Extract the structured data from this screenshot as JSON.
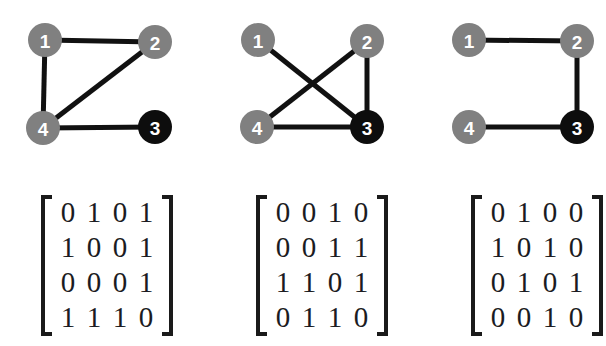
{
  "figure": {
    "background_color": "#ffffff",
    "node_colors": {
      "default": "#808080",
      "highlight": "#0d0d0d",
      "label": "#ffffff"
    },
    "edge_color": "#111111",
    "node_radius": 17,
    "matrix_text_color": "#1b1b22",
    "bracket_color": "#1a1a1a"
  },
  "panels": [
    {
      "id": "panel-1",
      "graph": {
        "nodes": [
          {
            "id": "1",
            "label": "1",
            "x": 45,
            "y": 40,
            "color": "#808080"
          },
          {
            "id": "2",
            "label": "2",
            "x": 155,
            "y": 42,
            "color": "#808080"
          },
          {
            "id": "3",
            "label": "3",
            "x": 155,
            "y": 127,
            "color": "#0d0d0d"
          },
          {
            "id": "4",
            "label": "4",
            "x": 43,
            "y": 128,
            "color": "#808080"
          }
        ],
        "edges": [
          {
            "from": "1",
            "to": "2"
          },
          {
            "from": "1",
            "to": "4"
          },
          {
            "from": "2",
            "to": "4"
          },
          {
            "from": "4",
            "to": "3"
          }
        ]
      },
      "matrix": {
        "rows": [
          [
            "0",
            "1",
            "0",
            "1"
          ],
          [
            "1",
            "0",
            "0",
            "1"
          ],
          [
            "0",
            "0",
            "0",
            "1"
          ],
          [
            "1",
            "1",
            "1",
            "0"
          ]
        ]
      }
    },
    {
      "id": "panel-2",
      "graph": {
        "nodes": [
          {
            "id": "1",
            "label": "1",
            "x": 58,
            "y": 40,
            "color": "#808080"
          },
          {
            "id": "2",
            "label": "2",
            "x": 167,
            "y": 41,
            "color": "#808080"
          },
          {
            "id": "3",
            "label": "3",
            "x": 167,
            "y": 127,
            "color": "#0d0d0d"
          },
          {
            "id": "4",
            "label": "4",
            "x": 57,
            "y": 127,
            "color": "#808080"
          }
        ],
        "edges": [
          {
            "from": "1",
            "to": "3"
          },
          {
            "from": "2",
            "to": "4"
          },
          {
            "from": "2",
            "to": "3"
          },
          {
            "from": "4",
            "to": "3"
          }
        ]
      },
      "matrix": {
        "rows": [
          [
            "0",
            "0",
            "1",
            "0"
          ],
          [
            "0",
            "0",
            "1",
            "1"
          ],
          [
            "1",
            "1",
            "0",
            "1"
          ],
          [
            "0",
            "1",
            "1",
            "0"
          ]
        ]
      }
    },
    {
      "id": "panel-3",
      "graph": {
        "nodes": [
          {
            "id": "1",
            "label": "1",
            "x": 65,
            "y": 40,
            "color": "#808080"
          },
          {
            "id": "2",
            "label": "2",
            "x": 173,
            "y": 41,
            "color": "#808080"
          },
          {
            "id": "3",
            "label": "3",
            "x": 173,
            "y": 127,
            "color": "#0d0d0d"
          },
          {
            "id": "4",
            "label": "4",
            "x": 65,
            "y": 127,
            "color": "#808080"
          }
        ],
        "edges": [
          {
            "from": "1",
            "to": "2"
          },
          {
            "from": "2",
            "to": "3"
          },
          {
            "from": "4",
            "to": "3"
          }
        ]
      },
      "matrix": {
        "rows": [
          [
            "0",
            "1",
            "0",
            "0"
          ],
          [
            "1",
            "0",
            "1",
            "0"
          ],
          [
            "0",
            "1",
            "0",
            "1"
          ],
          [
            "0",
            "0",
            "1",
            "0"
          ]
        ]
      }
    }
  ]
}
